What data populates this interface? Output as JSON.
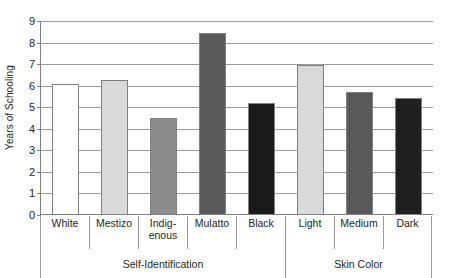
{
  "chart_data": {
    "type": "bar",
    "title": "",
    "xlabel": "",
    "ylabel": "Years of Schooling",
    "ylim": [
      0,
      9
    ],
    "ytick_labels": [
      "0",
      "1",
      "2",
      "3",
      "4",
      "5",
      "6",
      "7",
      "8",
      "9"
    ],
    "grid": true,
    "legend": "none",
    "categories": [
      "White",
      "Mestizo",
      "Indig-\nenous",
      "Mulatto",
      "Black",
      "Light",
      "Medium",
      "Dark"
    ],
    "values": [
      6.1,
      6.25,
      4.5,
      8.45,
      5.2,
      6.95,
      5.7,
      5.45
    ],
    "bar_colors": [
      "#ffffff",
      "#d9d9d9",
      "#8c8c8c",
      "#595959",
      "#1a1a1a",
      "#d9d9d9",
      "#595959",
      "#1f1f1f"
    ],
    "bar_border_color": "#808080",
    "groups": [
      {
        "label": "Self-Identification",
        "span": 5
      },
      {
        "label": "Skin Color",
        "span": 3
      }
    ]
  }
}
